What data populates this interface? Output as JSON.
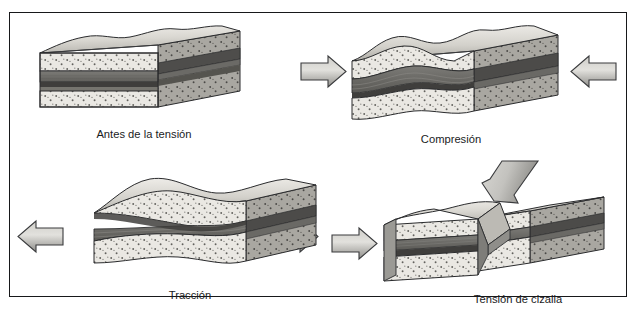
{
  "figure": {
    "title_visible": false,
    "border_color": "#17181a",
    "background_color": "#ffffff"
  },
  "palette": {
    "sand_light": "#e9e7e2",
    "sand_speckle": "#5d5c58",
    "dark_band": "#6f6e6b",
    "darkest_band": "#4b4a48",
    "side_face_dark": "#6a6964",
    "top_face_light": "#d8d6d0",
    "outline": "#2a2b2d",
    "arrow_fill_light": "#d5d4d0",
    "arrow_fill_dark": "#8d8c88",
    "arrow_outline": "#3a3b3d",
    "caption_color": "#1a1b1d"
  },
  "panels": [
    {
      "id": "before-stress",
      "caption": "Antes de la tensión",
      "block_shape": "flat-undeformed-block",
      "arrows": []
    },
    {
      "id": "compression",
      "caption": "Compresión",
      "block_shape": "folded-thickened-block",
      "arrows": [
        {
          "name": "compression-arrow-left",
          "direction": "right"
        },
        {
          "name": "compression-arrow-right",
          "direction": "left"
        }
      ]
    },
    {
      "id": "tension",
      "caption": "Tracción",
      "block_shape": "stretched-necked-block",
      "arrows": [
        {
          "name": "tension-arrow-left",
          "direction": "left"
        },
        {
          "name": "tension-arrow-right",
          "direction": "right"
        }
      ]
    },
    {
      "id": "shear-stress",
      "caption": "Tensión de cizalla",
      "block_shape": "offset-faulted-block",
      "arrows": [
        {
          "name": "shear-arrow-diagonal",
          "direction": "down-left"
        },
        {
          "name": "shear-arrow-left",
          "direction": "right"
        }
      ]
    }
  ],
  "layers": [
    {
      "name": "upper-sandstone",
      "style": "light-speckled"
    },
    {
      "name": "upper-dark-shale",
      "style": "dark-band"
    },
    {
      "name": "core-dark-layer",
      "style": "darkest-band"
    },
    {
      "name": "lower-dark-shale",
      "style": "dark-band"
    },
    {
      "name": "lower-sandstone",
      "style": "light-speckled"
    }
  ]
}
